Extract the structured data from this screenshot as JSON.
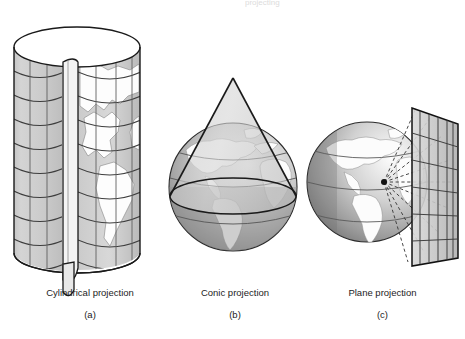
{
  "figure": {
    "kind": "map-projection-diagram",
    "background": "#ffffff",
    "top_cut_text": "projecting",
    "panels": [
      {
        "id": "a",
        "name": "cylindrical-projection",
        "title": "Cylindrical projection",
        "sublabel": "(a)",
        "shape": "cylinder",
        "description": "Upright cylinder wrapped around the globe, slit open on the right with grid graticule and the Americas projected on its surface",
        "graticule": {
          "parallels": 9,
          "meridians": 5
        }
      },
      {
        "id": "b",
        "name": "conic-projection",
        "title": "Conic projection",
        "sublabel": "(b)",
        "shape": "cone-over-globe",
        "description": "Transparent cone resting on a globe, intersecting it along a standard parallel",
        "graticule": {
          "parallels": 3,
          "meridians": 0
        }
      },
      {
        "id": "c",
        "name": "plane-projection",
        "title": "Plane projection",
        "sublabel": "(c)",
        "shape": "plane-tangent-to-globe",
        "description": "Globe with a point source radiating dashed rays onto a tilted flat grid plane tangent at the right",
        "graticule": {
          "parallels": 6,
          "meridians": 6
        },
        "projection_point_marker": "black-dot"
      }
    ]
  },
  "colors": {
    "outline": "#1a1a1a",
    "line": "#4a4a4a",
    "surface_light": "#cfcfcf",
    "surface_mid": "#b4b4b4",
    "globe_shadow": "#8a8a8a",
    "globe_dark": "#6f6f6f",
    "land": "#fdfdfd",
    "caption": "#1c1c1c",
    "background": "#ffffff"
  }
}
